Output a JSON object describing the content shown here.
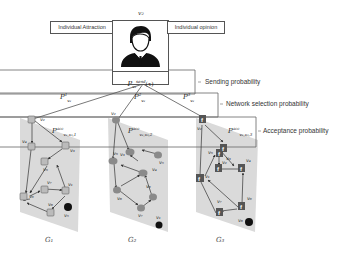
{
  "top_node": {
    "label": "v₂",
    "left_box": "Individual Attraction",
    "right_box": "Individual opinion",
    "send_label": "P",
    "send_sup": "send",
    "send_sub": "v₂",
    "send_arg": "(τ)"
  },
  "layers": {
    "sending": "Sending probability",
    "network_selection": "Network selection probability",
    "acceptance": "Acceptance probability"
  },
  "edges_top": [
    {
      "label": "P",
      "sup": "1",
      "sub": "v₂"
    },
    {
      "label": "P",
      "sup": "2",
      "sub": "v₂"
    },
    {
      "label": "P",
      "sup": "3",
      "sub": "v₂"
    }
  ],
  "networks": [
    {
      "name": "G₁",
      "icon": "wechat-like-square-icon",
      "acc_label": {
        "label": "P",
        "sup": "acc",
        "sub": "v₂,v₃,1"
      },
      "nodes": [
        "v₂",
        "v₄",
        "v₃",
        "v₉",
        "v₆",
        "v₇",
        "v₁",
        "v₈",
        "v₅"
      ]
    },
    {
      "name": "G₂",
      "icon": "twitter-bird-icon",
      "acc_label": {
        "label": "P",
        "sup": "acc",
        "sub": "v₂,v₃,2"
      },
      "nodes": [
        "v₂",
        "v₉",
        "v₃",
        "v₅",
        "v₄",
        "v₆",
        "v₈",
        "v₇",
        "v₁"
      ]
    },
    {
      "name": "G₃",
      "icon": "facebook-f-icon",
      "acc_label": {
        "label": "P",
        "sup": "acc",
        "sub": "v₂,v₃,3"
      },
      "nodes": [
        "v₂",
        "v₃",
        "v₉",
        "v₂",
        "v₄",
        "v₁",
        "v₇",
        "v₆",
        "v₈"
      ]
    }
  ],
  "colors": {
    "plane": "#d9d9d9",
    "line": "#555555",
    "node_dark": "#111111",
    "bird": "#8a8a8a"
  }
}
